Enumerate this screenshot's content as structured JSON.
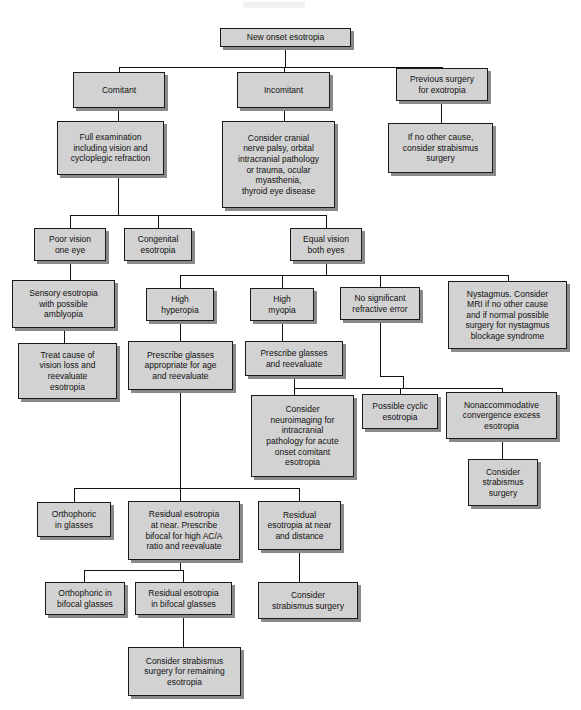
{
  "diagram": {
    "box_fill": "#d2d2d2",
    "box_border": "#1a1a1a",
    "shadow": "#8a8a8a",
    "background": "#ffffff"
  },
  "nodes": [
    {
      "id": "new-onset-esotropia",
      "label": "New onset esotropia",
      "x": 220,
      "y": 28,
      "w": 131,
      "h": 19
    },
    {
      "id": "comitant",
      "label": "Comitant",
      "x": 73,
      "y": 72,
      "w": 92,
      "h": 36
    },
    {
      "id": "incomitant",
      "label": "Incomitant",
      "x": 237,
      "y": 72,
      "w": 93,
      "h": 36
    },
    {
      "id": "previous-surgery-for-exotropia",
      "label": "Previous surgery\nfor exotropia",
      "x": 396,
      "y": 68,
      "w": 92,
      "h": 33
    },
    {
      "id": "full-examination",
      "label": "Full examination\nincluding vision and\ncycloplegic refraction",
      "x": 57,
      "y": 121,
      "w": 107,
      "h": 54
    },
    {
      "id": "consider-cranial-nerve-palsy",
      "label": "Consider cranial\nnerve palsy, orbital\nintracranial pathology\nor trauma, ocular\nmyasthenia,\nthyroid eye disease",
      "x": 222,
      "y": 121,
      "w": 113,
      "h": 87
    },
    {
      "id": "if-no-other-cause",
      "label": "If no other cause,\nconsider strabismus\nsurgery",
      "x": 388,
      "y": 123,
      "w": 105,
      "h": 50
    },
    {
      "id": "poor-vision-one-eye",
      "label": "Poor vision\none eye",
      "x": 34,
      "y": 228,
      "w": 72,
      "h": 33
    },
    {
      "id": "congenital-esotropia",
      "label": "Congenital\nesotropia",
      "x": 124,
      "y": 228,
      "w": 68,
      "h": 33
    },
    {
      "id": "equal-vision-both-eyes",
      "label": "Equal vision\nboth eyes",
      "x": 290,
      "y": 228,
      "w": 72,
      "h": 33
    },
    {
      "id": "sensory-esotropia",
      "label": "Sensory esotropia\nwith possible\namblyopia",
      "x": 12,
      "y": 280,
      "w": 103,
      "h": 48
    },
    {
      "id": "high-hyperopia",
      "label": "High\nhyperopia",
      "x": 146,
      "y": 288,
      "w": 68,
      "h": 33
    },
    {
      "id": "high-myopia",
      "label": "High\nmyopia",
      "x": 250,
      "y": 288,
      "w": 64,
      "h": 33
    },
    {
      "id": "no-significant-refractive-error",
      "label": "No significant\nrefractive error",
      "x": 340,
      "y": 287,
      "w": 80,
      "h": 33
    },
    {
      "id": "nystagmus-consider-mri",
      "label": "Nystagmus. Consider\nMRI if no other cause\nand if normal possible\nsurgery for nystagmus\nblockage syndrome",
      "x": 448,
      "y": 281,
      "w": 119,
      "h": 68
    },
    {
      "id": "treat-cause-of-vision-loss",
      "label": "Treat cause of\nvision loss and\nreevaluate\nesotropia",
      "x": 18,
      "y": 343,
      "w": 99,
      "h": 56
    },
    {
      "id": "prescribe-glasses-appropriate",
      "label": "Prescribe glasses\nappropriate for age\nand reevaluate",
      "x": 128,
      "y": 341,
      "w": 105,
      "h": 49
    },
    {
      "id": "prescribe-glasses-and-reevaluate",
      "label": "Prescribe glasses\nand reevaluate",
      "x": 245,
      "y": 341,
      "w": 98,
      "h": 35
    },
    {
      "id": "consider-neuroimaging",
      "label": "Consider\nneuroimaging for\nintracranial\npathology for acute\nonset comitant\nesotropia",
      "x": 251,
      "y": 395,
      "w": 103,
      "h": 82
    },
    {
      "id": "possible-cyclic-esotropia",
      "label": "Possible cyclic\nesotropia",
      "x": 362,
      "y": 394,
      "w": 76,
      "h": 35
    },
    {
      "id": "nonaccommodative-convergence-excess",
      "label": "Nonaccommodative\nconvergence excess\nesotropia",
      "x": 446,
      "y": 392,
      "w": 111,
      "h": 47
    },
    {
      "id": "consider-strabismus-surgery-right",
      "label": "Consider\nstrabismus\nsurgery",
      "x": 468,
      "y": 459,
      "w": 70,
      "h": 47
    },
    {
      "id": "orthophoric-in-glasses",
      "label": "Orthophoric\nin glasses",
      "x": 37,
      "y": 502,
      "w": 74,
      "h": 35
    },
    {
      "id": "residual-esotropia-at-near",
      "label": "Residual esotropia\nat near. Prescribe\nbifocal for high AC/A\nratio and reevaluate",
      "x": 128,
      "y": 501,
      "w": 112,
      "h": 59
    },
    {
      "id": "residual-esotropia-near-distance",
      "label": "Residual\nesotropia at near\nand distance",
      "x": 258,
      "y": 501,
      "w": 83,
      "h": 49
    },
    {
      "id": "orthophoric-in-bifocal-glasses",
      "label": "Orthophoric in\nbifocal glasses",
      "x": 45,
      "y": 582,
      "w": 80,
      "h": 33
    },
    {
      "id": "residual-esotropia-in-bifocal",
      "label": "Residual esotropia\nin bifocal glasses",
      "x": 135,
      "y": 582,
      "w": 97,
      "h": 33
    },
    {
      "id": "consider-strabismus-surgery-mid",
      "label": "Consider\nstrabismus surgery",
      "x": 258,
      "y": 582,
      "w": 100,
      "h": 37
    },
    {
      "id": "consider-strabismus-remaining",
      "label": "Consider strabismus\nsurgery for remaining\nesotropia",
      "x": 128,
      "y": 647,
      "w": 113,
      "h": 49
    }
  ],
  "edges": [
    {
      "id": "e-root-down",
      "o": "v",
      "x": 285,
      "y": 47,
      "len": 21
    },
    {
      "id": "e-level1-bus",
      "o": "h",
      "x": 119,
      "y": 67,
      "len": 324
    },
    {
      "id": "e-bus-to-comitant",
      "o": "v",
      "x": 119,
      "y": 67,
      "len": 5
    },
    {
      "id": "e-bus-to-incomitant",
      "o": "v",
      "x": 284,
      "y": 67,
      "len": 5
    },
    {
      "id": "e-bus-to-previous",
      "o": "v",
      "x": 442,
      "y": 67,
      "len": 5
    },
    {
      "id": "e-comitant-down",
      "o": "v",
      "x": 118,
      "y": 108,
      "len": 13
    },
    {
      "id": "e-incomitant-down",
      "o": "v",
      "x": 284,
      "y": 108,
      "len": 13
    },
    {
      "id": "e-previous-down",
      "o": "v",
      "x": 441,
      "y": 101,
      "len": 22
    },
    {
      "id": "e-fullexam-down",
      "o": "v",
      "x": 118,
      "y": 175,
      "len": 40
    },
    {
      "id": "e-level2-bus-left",
      "o": "h",
      "x": 70,
      "y": 215,
      "len": 256
    },
    {
      "id": "e-bus-poor-vision",
      "o": "v",
      "x": 70,
      "y": 215,
      "len": 13
    },
    {
      "id": "e-bus-congenital",
      "o": "v",
      "x": 158,
      "y": 215,
      "len": 13
    },
    {
      "id": "e-bus-equal-vision",
      "o": "v",
      "x": 326,
      "y": 215,
      "len": 13
    },
    {
      "id": "e-poorvision-down",
      "o": "v",
      "x": 70,
      "y": 261,
      "len": 19
    },
    {
      "id": "e-sensory-down",
      "o": "v",
      "x": 64,
      "y": 328,
      "len": 15
    },
    {
      "id": "e-equalvision-down",
      "o": "v",
      "x": 326,
      "y": 261,
      "len": 14
    },
    {
      "id": "e-level3-bus",
      "o": "h",
      "x": 180,
      "y": 275,
      "len": 328
    },
    {
      "id": "e-bus-hyperopia",
      "o": "v",
      "x": 180,
      "y": 275,
      "len": 13
    },
    {
      "id": "e-bus-myopia",
      "o": "v",
      "x": 282,
      "y": 275,
      "len": 13
    },
    {
      "id": "e-bus-nosig",
      "o": "v",
      "x": 380,
      "y": 275,
      "len": 12
    },
    {
      "id": "e-bus-nystagmus",
      "o": "v",
      "x": 508,
      "y": 275,
      "len": 6
    },
    {
      "id": "e-hyperopia-down",
      "o": "v",
      "x": 180,
      "y": 321,
      "len": 20
    },
    {
      "id": "e-myopia-down",
      "o": "v",
      "x": 282,
      "y": 321,
      "len": 20
    },
    {
      "id": "e-prescribe-re-down",
      "o": "v",
      "x": 294,
      "y": 376,
      "len": 19
    },
    {
      "id": "e-nosig-down",
      "o": "v",
      "x": 380,
      "y": 320,
      "len": 56
    },
    {
      "id": "e-nosig-jog",
      "o": "h",
      "x": 380,
      "y": 376,
      "len": 23
    },
    {
      "id": "e-nosig-jog-v",
      "o": "v",
      "x": 403,
      "y": 376,
      "len": 12
    },
    {
      "id": "e-level4-bus",
      "o": "h",
      "x": 294,
      "y": 388,
      "len": 208
    },
    {
      "id": "e-bus-neuroimaging",
      "o": "v",
      "x": 294,
      "y": 388,
      "len": 7
    },
    {
      "id": "e-bus-cyclic",
      "o": "v",
      "x": 400,
      "y": 388,
      "len": 6
    },
    {
      "id": "e-bus-nonaccom",
      "o": "v",
      "x": 502,
      "y": 388,
      "len": 5
    },
    {
      "id": "e-nonaccom-down",
      "o": "v",
      "x": 502,
      "y": 439,
      "len": 20
    },
    {
      "id": "e-prescribeage-down",
      "o": "v",
      "x": 180,
      "y": 390,
      "len": 98
    },
    {
      "id": "e-level5-bus",
      "o": "h",
      "x": 74,
      "y": 488,
      "len": 225
    },
    {
      "id": "e-bus-orthophoric",
      "o": "v",
      "x": 74,
      "y": 488,
      "len": 14
    },
    {
      "id": "e-bus-residual-near",
      "o": "v",
      "x": 180,
      "y": 488,
      "len": 13
    },
    {
      "id": "e-bus-residual-near-dist",
      "o": "v",
      "x": 299,
      "y": 488,
      "len": 13
    },
    {
      "id": "e-residual-near-down",
      "o": "v",
      "x": 180,
      "y": 560,
      "len": 10
    },
    {
      "id": "e-level6-bus",
      "o": "h",
      "x": 84,
      "y": 570,
      "len": 99
    },
    {
      "id": "e-bus-ortho-bifocal",
      "o": "v",
      "x": 84,
      "y": 570,
      "len": 12
    },
    {
      "id": "e-bus-residual-bifocal",
      "o": "v",
      "x": 183,
      "y": 570,
      "len": 12
    },
    {
      "id": "e-residual-bifocal-down",
      "o": "v",
      "x": 183,
      "y": 615,
      "len": 32
    },
    {
      "id": "e-residual-neardist-down",
      "o": "v",
      "x": 299,
      "y": 550,
      "len": 32
    }
  ]
}
